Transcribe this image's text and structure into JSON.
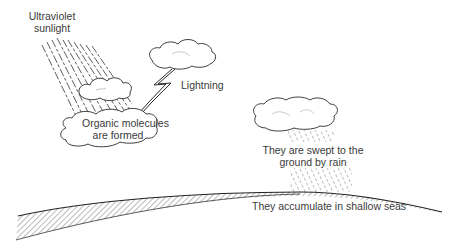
{
  "diagram": {
    "labels": {
      "uv_line1": "Ultraviolet",
      "uv_line2": "sunlight",
      "lightning": "Lightning",
      "organic_line1": "Organic molecules",
      "organic_line2": "are formed",
      "swept_line1": "They are swept to the",
      "swept_line2": "ground by rain",
      "accumulate": "They accumulate in shallow seas"
    },
    "colors": {
      "ink": "#2a2a2a",
      "text": "#3a3a3a",
      "background": "#ffffff"
    }
  }
}
